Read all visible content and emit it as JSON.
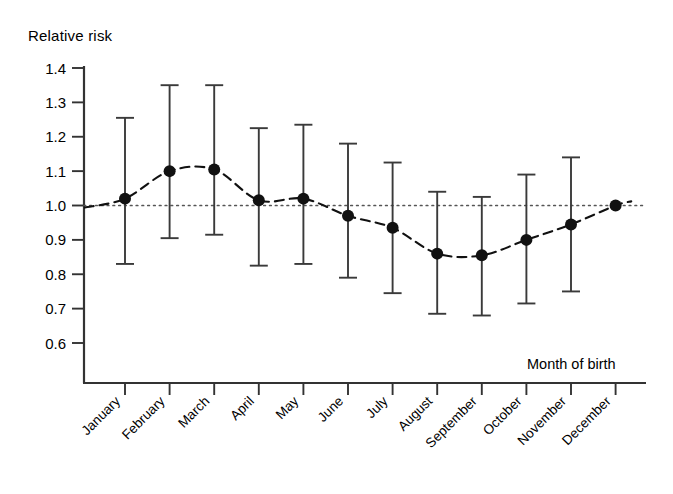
{
  "chart_data": {
    "type": "scatter",
    "title": "",
    "xlabel": "Month of birth",
    "ylabel": "Relative risk",
    "ylim": [
      0.55,
      1.43
    ],
    "yticks": [
      0.6,
      0.7,
      0.8,
      0.9,
      1.0,
      1.1,
      1.2,
      1.3,
      1.4
    ],
    "ytick_labels": [
      "0.6",
      "0.7",
      "0.8",
      "0.9",
      "1.0",
      "1.1",
      "1.2",
      "1.3",
      "1.4"
    ],
    "grid": false,
    "legend": "none",
    "reference_line": {
      "value": 1.0,
      "style": "dotted"
    },
    "fit_curve": {
      "style": "dashed",
      "label": ""
    },
    "categories": [
      "January",
      "February",
      "March",
      "April",
      "May",
      "June",
      "July",
      "August",
      "September",
      "October",
      "November",
      "December"
    ],
    "values": [
      1.02,
      1.1,
      1.105,
      1.015,
      1.02,
      0.97,
      0.935,
      0.86,
      0.855,
      0.9,
      0.945,
      1.0
    ],
    "ci_lower": [
      0.83,
      0.905,
      0.915,
      0.825,
      0.83,
      0.79,
      0.745,
      0.685,
      0.68,
      0.715,
      0.75,
      null
    ],
    "ci_upper": [
      1.255,
      1.35,
      1.35,
      1.225,
      1.235,
      1.18,
      1.125,
      1.04,
      1.025,
      1.09,
      1.14,
      null
    ],
    "series": [
      {
        "name": "Relative risk",
        "values": [
          1.02,
          1.1,
          1.105,
          1.015,
          1.02,
          0.97,
          0.935,
          0.86,
          0.855,
          0.9,
          0.945,
          1.0
        ]
      }
    ],
    "colors": {
      "marker": "#111111",
      "errorbar": "#3a3a3a",
      "curve": "#111111",
      "reference": "#555555",
      "axis": "#333333"
    }
  }
}
